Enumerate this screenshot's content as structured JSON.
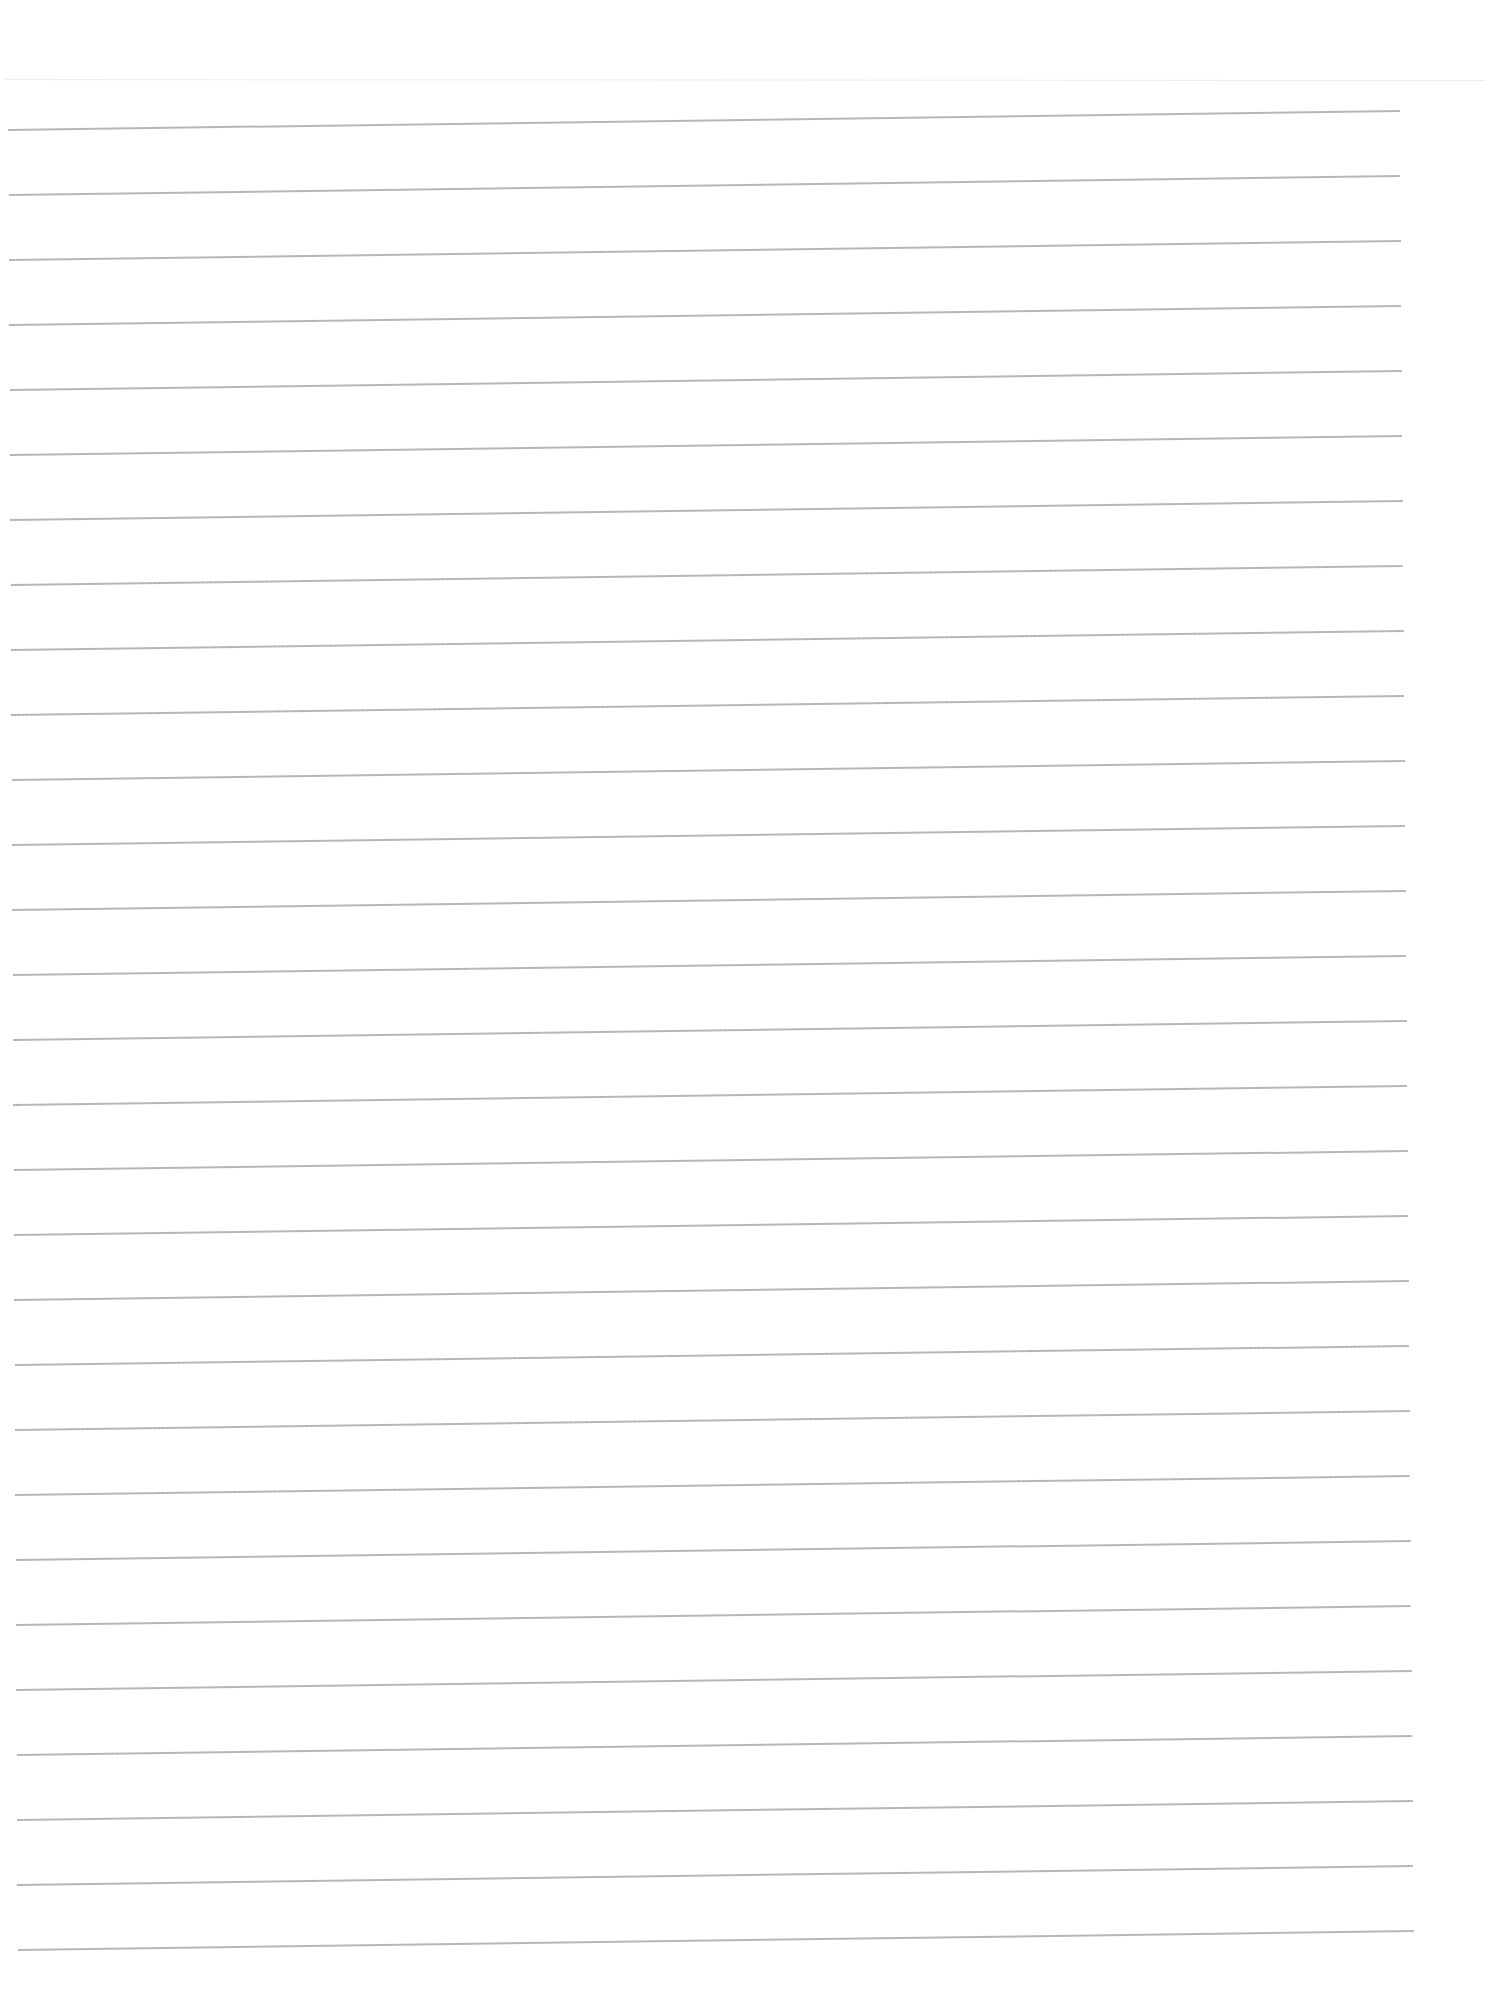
{
  "document": {
    "type": "blank-ruled-sheet",
    "background_color": "#ffffff",
    "rule_color": "#a6a6a6",
    "header_line_color": "#ececec",
    "header_line_y": 79,
    "rules": [
      {
        "x1": 8,
        "y1": 129,
        "x2": 1400,
        "y2": 110
      },
      {
        "x1": 9,
        "y1": 194,
        "x2": 1400,
        "y2": 175
      },
      {
        "x1": 9,
        "y1": 259,
        "x2": 1401,
        "y2": 240
      },
      {
        "x1": 9,
        "y1": 324,
        "x2": 1401,
        "y2": 305
      },
      {
        "x1": 10,
        "y1": 389,
        "x2": 1402,
        "y2": 370
      },
      {
        "x1": 10,
        "y1": 454,
        "x2": 1402,
        "y2": 435
      },
      {
        "x1": 10,
        "y1": 519,
        "x2": 1403,
        "y2": 500
      },
      {
        "x1": 11,
        "y1": 584,
        "x2": 1403,
        "y2": 565
      },
      {
        "x1": 11,
        "y1": 649,
        "x2": 1404,
        "y2": 630
      },
      {
        "x1": 11,
        "y1": 714,
        "x2": 1404,
        "y2": 695
      },
      {
        "x1": 12,
        "y1": 779,
        "x2": 1405,
        "y2": 760
      },
      {
        "x1": 12,
        "y1": 844,
        "x2": 1405,
        "y2": 825
      },
      {
        "x1": 12,
        "y1": 909,
        "x2": 1406,
        "y2": 890
      },
      {
        "x1": 13,
        "y1": 974,
        "x2": 1406,
        "y2": 955
      },
      {
        "x1": 13,
        "y1": 1039,
        "x2": 1407,
        "y2": 1020
      },
      {
        "x1": 13,
        "y1": 1104,
        "x2": 1407,
        "y2": 1085
      },
      {
        "x1": 14,
        "y1": 1169,
        "x2": 1408,
        "y2": 1150
      },
      {
        "x1": 14,
        "y1": 1234,
        "x2": 1408,
        "y2": 1215
      },
      {
        "x1": 14,
        "y1": 1299,
        "x2": 1409,
        "y2": 1280
      },
      {
        "x1": 15,
        "y1": 1364,
        "x2": 1409,
        "y2": 1345
      },
      {
        "x1": 15,
        "y1": 1429,
        "x2": 1410,
        "y2": 1410
      },
      {
        "x1": 15,
        "y1": 1494,
        "x2": 1410,
        "y2": 1475
      },
      {
        "x1": 16,
        "y1": 1559,
        "x2": 1411,
        "y2": 1540
      },
      {
        "x1": 16,
        "y1": 1624,
        "x2": 1411,
        "y2": 1605
      },
      {
        "x1": 16,
        "y1": 1689,
        "x2": 1412,
        "y2": 1670
      },
      {
        "x1": 17,
        "y1": 1754,
        "x2": 1412,
        "y2": 1735
      },
      {
        "x1": 17,
        "y1": 1819,
        "x2": 1413,
        "y2": 1800
      },
      {
        "x1": 17,
        "y1": 1884,
        "x2": 1413,
        "y2": 1865
      },
      {
        "x1": 18,
        "y1": 1949,
        "x2": 1414,
        "y2": 1930
      }
    ]
  }
}
